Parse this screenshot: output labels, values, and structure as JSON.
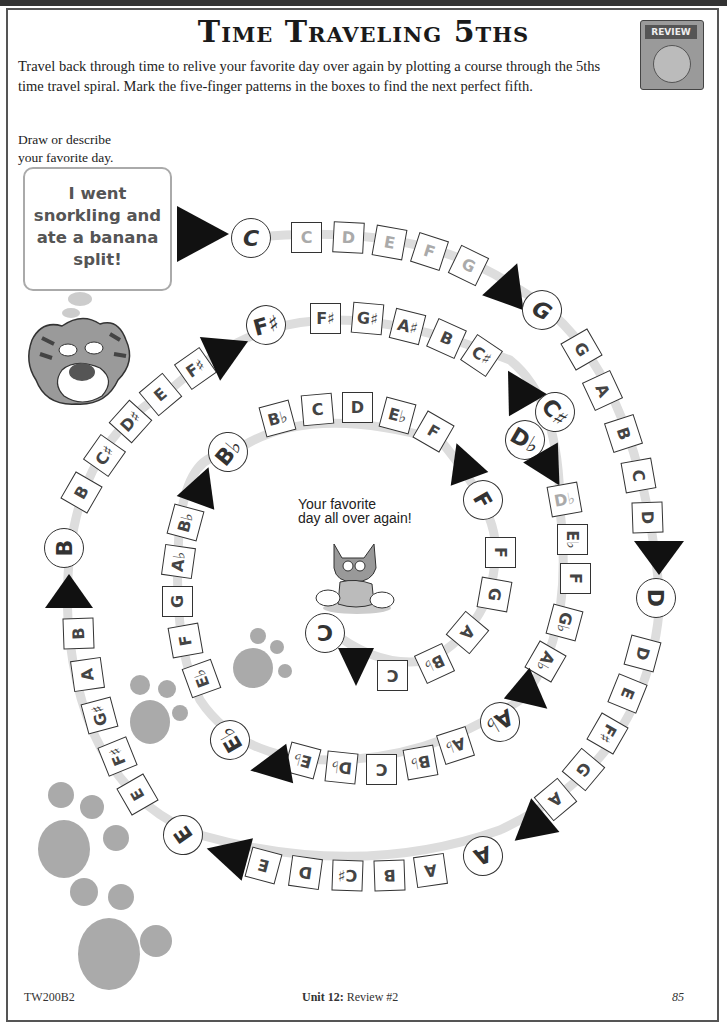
{
  "header": {
    "title": "Time Traveling 5ths",
    "badge_label": "REVIEW",
    "intro": "Travel back through time to relive your favorite day over again by plotting a course through the 5ths time travel spiral. Mark the five-finger patterns in the boxes to find the next perfect fifth."
  },
  "prompt": {
    "label_line1": "Draw or describe",
    "label_line2": "your favorite day.",
    "answer": "I went snorkling and ate a banana split!"
  },
  "center": {
    "line1": "Your favorite",
    "line2": "day all over again!"
  },
  "spiral": {
    "segments": [
      {
        "start": "C",
        "boxes": [
          "C",
          "D",
          "E",
          "F",
          "G"
        ],
        "next": "G",
        "example": true
      },
      {
        "start": "G",
        "boxes": [
          "G",
          "A",
          "B",
          "C",
          "D"
        ],
        "next": "D"
      },
      {
        "start": "D",
        "boxes": [
          "D",
          "E",
          "F♯",
          "G",
          "A"
        ],
        "next": "A"
      },
      {
        "start": "A",
        "boxes": [
          "A",
          "B",
          "C♯",
          "D",
          "E"
        ],
        "next": "E"
      },
      {
        "start": "E",
        "boxes": [
          "E",
          "F♯",
          "G♯",
          "A",
          "B"
        ],
        "next": "B"
      },
      {
        "start": "B",
        "boxes": [
          "B",
          "C♯",
          "D♯",
          "E",
          "F♯"
        ],
        "next": "F♯"
      },
      {
        "start": "F♯",
        "boxes": [
          "F♯",
          "G♯",
          "A♯",
          "B",
          "C♯"
        ],
        "next": "C♯"
      },
      {
        "start": "D♭",
        "boxes": [
          "D♭",
          "E♭",
          "F",
          "G♭",
          "A♭"
        ],
        "next": "A♭"
      },
      {
        "start": "A♭",
        "boxes": [
          "A♭",
          "B♭",
          "C",
          "D♭",
          "E♭"
        ],
        "next": "E♭"
      },
      {
        "start": "E♭",
        "boxes": [
          "E♭",
          "F",
          "G",
          "A♭",
          "B♭"
        ],
        "next": "B♭"
      },
      {
        "start": "B♭",
        "boxes": [
          "B♭",
          "C",
          "D",
          "E♭",
          "F"
        ],
        "next": "F"
      },
      {
        "start": "F",
        "boxes": [
          "F",
          "G",
          "A",
          "B♭",
          "C"
        ],
        "next": "C"
      }
    ],
    "enharmonic_node": "C♯"
  },
  "footer": {
    "code": "TW200B2",
    "unit_bold": "Unit 12:",
    "unit_rest": " Review #2",
    "page": "85"
  }
}
